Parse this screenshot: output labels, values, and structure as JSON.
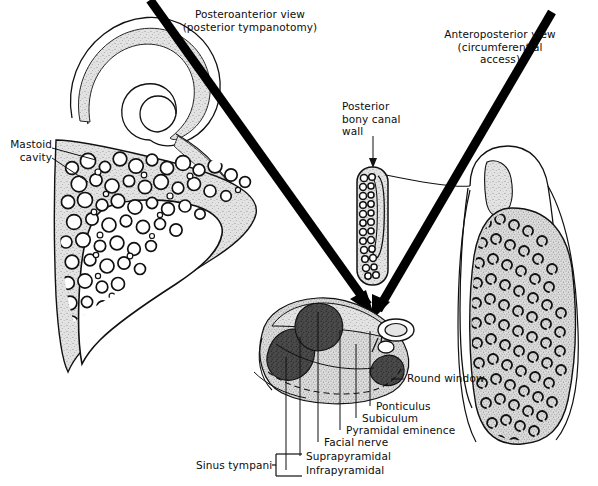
{
  "figure": {
    "title_left": "Posteroanterior view\n(posterior tympanotomy)",
    "title_right": "Anteroposterior view\n(circumferential\naccess)",
    "labels": {
      "mastoid_cavity": "Mastoid\ncavity",
      "posterior_bony_canal_wall": "Posterior\nbony canal\nwall",
      "round_window": "Round window",
      "ponticulus": "Ponticulus",
      "subiculum": "Subiculum",
      "pyramidal_eminence": "Pyramidal eminence",
      "facial_nerve": "Facial nerve",
      "suprapyramidal": "Suprapyramidal",
      "infrapyramidal": "Infrapyramidal",
      "sinus_tympani": "Sinus tympani"
    },
    "colors": {
      "background": "#ffffff",
      "ink": "#000000",
      "stipple_light": "#dedede",
      "stipple_mid": "#c8c8c8",
      "recess_dark": "#3a3a3a",
      "arrow_black": "#000000"
    }
  }
}
